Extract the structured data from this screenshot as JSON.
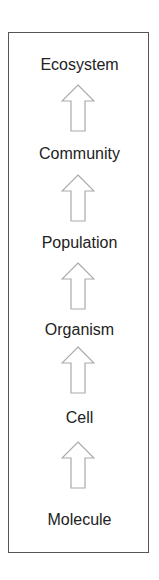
{
  "diagram": {
    "levels": [
      {
        "label": "Ecosystem"
      },
      {
        "label": "Community"
      },
      {
        "label": "Population"
      },
      {
        "label": "Organism"
      },
      {
        "label": "Cell"
      },
      {
        "label": "Molecule"
      }
    ],
    "arrow_color": "#aaaaaa",
    "border_color": "#555555"
  }
}
